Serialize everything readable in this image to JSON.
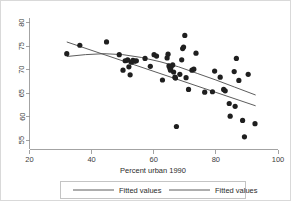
{
  "chart_data": {
    "type": "scatter",
    "title": "",
    "subtitle": "",
    "xlabel": "Percent urban 1990",
    "ylabel": "",
    "xlim": [
      20,
      100
    ],
    "ylim": [
      53,
      81
    ],
    "grid": false,
    "xticks": [
      20,
      40,
      60,
      80,
      100
    ],
    "xtick_labels": [
      "20",
      "40",
      "60",
      "80",
      "100"
    ],
    "yticks": [
      55,
      60,
      65,
      70,
      75,
      80
    ],
    "ytick_labels": [
      "55",
      "60",
      "65",
      "70",
      "75",
      "80"
    ],
    "legend": {
      "position": "bottom",
      "entries": [
        {
          "label": "Fitted values",
          "marker": "line",
          "color": "#4a4a4a"
        },
        {
          "label": "Fitted values",
          "marker": "line",
          "color": "#4a4a4a"
        }
      ]
    },
    "scatter": {
      "name": "observations",
      "color": "#1f1f1f",
      "points": [
        [
          32.0,
          73.4
        ],
        [
          36.2,
          75.2
        ],
        [
          44.8,
          75.9
        ],
        [
          48.9,
          73.2
        ],
        [
          50.1,
          69.9
        ],
        [
          50.8,
          71.9
        ],
        [
          51.6,
          72.1
        ],
        [
          52.0,
          70.6
        ],
        [
          52.4,
          68.9
        ],
        [
          52.8,
          71.6
        ],
        [
          53.3,
          72.0
        ],
        [
          53.9,
          71.8
        ],
        [
          54.4,
          71.9
        ],
        [
          57.2,
          72.4
        ],
        [
          58.9,
          70.7
        ],
        [
          60.1,
          73.2
        ],
        [
          60.9,
          72.9
        ],
        [
          62.8,
          67.8
        ],
        [
          64.3,
          72.5
        ],
        [
          64.6,
          73.3
        ],
        [
          64.9,
          70.8
        ],
        [
          65.2,
          70.3
        ],
        [
          65.4,
          69.9
        ],
        [
          65.6,
          70.6
        ],
        [
          66.1,
          71.0
        ],
        [
          66.4,
          69.5
        ],
        [
          66.8,
          68.4
        ],
        [
          67.0,
          68.2
        ],
        [
          67.3,
          57.9
        ],
        [
          68.4,
          69.0
        ],
        [
          69.0,
          72.1
        ],
        [
          69.3,
          74.5
        ],
        [
          69.6,
          74.8
        ],
        [
          70.0,
          77.3
        ],
        [
          70.4,
          68.3
        ],
        [
          71.2,
          65.8
        ],
        [
          72.3,
          69.9
        ],
        [
          72.9,
          70.1
        ],
        [
          73.6,
          73.5
        ],
        [
          76.4,
          65.2
        ],
        [
          78.9,
          65.3
        ],
        [
          79.6,
          69.7
        ],
        [
          81.4,
          68.4
        ],
        [
          82.5,
          65.8
        ],
        [
          83.0,
          65.5
        ],
        [
          84.3,
          62.8
        ],
        [
          84.6,
          60.1
        ],
        [
          85.9,
          69.6
        ],
        [
          86.2,
          62.2
        ],
        [
          86.6,
          72.4
        ],
        [
          87.4,
          67.7
        ],
        [
          88.6,
          59.2
        ],
        [
          89.2,
          55.7
        ],
        [
          90.4,
          69.0
        ],
        [
          92.6,
          58.5
        ]
      ]
    },
    "series": [
      {
        "name": "Fitted values",
        "type": "line",
        "style": "linear",
        "color": "#4a4a4a",
        "points": [
          [
            32.0,
            75.9
          ],
          [
            92.8,
            62.3
          ]
        ]
      },
      {
        "name": "Fitted values",
        "type": "line",
        "style": "curve",
        "color": "#4a4a4a",
        "points": [
          [
            32.0,
            72.8
          ],
          [
            38.0,
            73.2
          ],
          [
            44.0,
            73.4
          ],
          [
            50.0,
            73.2
          ],
          [
            56.0,
            72.6
          ],
          [
            62.0,
            71.7
          ],
          [
            68.0,
            70.6
          ],
          [
            74.0,
            69.2
          ],
          [
            80.0,
            67.8
          ],
          [
            86.0,
            66.3
          ],
          [
            92.8,
            64.6
          ]
        ]
      }
    ]
  }
}
